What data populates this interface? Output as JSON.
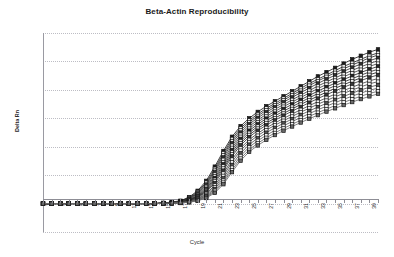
{
  "chart_data": {
    "type": "line",
    "title": "Beta-Actin Reproducibility",
    "xlabel": "Cycle",
    "ylabel": "Delta Rn",
    "grid": true,
    "legend": "none",
    "marker": "square",
    "xlim": [
      1,
      40
    ],
    "ylim": [
      -0.2,
      1.2
    ],
    "ytick_labels": [
      "1.20",
      "1.00",
      "0.80",
      "0.60",
      "0.40",
      "0.20",
      "0.00",
      "-0.20"
    ],
    "ytick_values": [
      1.2,
      1.0,
      0.8,
      0.6,
      0.4,
      0.2,
      0.0,
      -0.2
    ],
    "xtick_labels": [
      "1",
      "3",
      "5",
      "7",
      "9",
      "11",
      "13",
      "15",
      "17",
      "19",
      "21",
      "23",
      "25",
      "27",
      "29",
      "31",
      "33",
      "35",
      "37",
      "39"
    ],
    "xtick_values": [
      1,
      3,
      5,
      7,
      9,
      11,
      13,
      15,
      17,
      19,
      21,
      23,
      25,
      27,
      29,
      31,
      33,
      35,
      37,
      39
    ],
    "x": [
      1,
      2,
      3,
      4,
      5,
      6,
      7,
      8,
      9,
      10,
      11,
      12,
      13,
      14,
      15,
      16,
      17,
      18,
      19,
      20,
      21,
      22,
      23,
      24,
      25,
      26,
      27,
      28,
      29,
      30,
      31,
      32,
      33,
      34,
      35,
      36,
      37,
      38,
      39,
      40
    ],
    "series": [
      {
        "name": "Replicate 1",
        "color": "#1c1c1c",
        "values": [
          0.0,
          0.0,
          0.0,
          0.0,
          0.0,
          0.0,
          0.0,
          0.0,
          0.0,
          0.0,
          0.0,
          0.0,
          0.0,
          0.0,
          0.005,
          0.01,
          0.02,
          0.045,
          0.09,
          0.16,
          0.26,
          0.37,
          0.47,
          0.545,
          0.6,
          0.645,
          0.685,
          0.72,
          0.755,
          0.79,
          0.825,
          0.86,
          0.895,
          0.925,
          0.955,
          0.985,
          1.015,
          1.04,
          1.065,
          1.085
        ]
      },
      {
        "name": "Replicate 2",
        "color": "#232323",
        "values": [
          0.0,
          0.0,
          0.0,
          0.0,
          0.0,
          0.0,
          0.0,
          0.0,
          0.0,
          0.0,
          0.0,
          0.0,
          0.0,
          0.0,
          0.004,
          0.009,
          0.018,
          0.04,
          0.082,
          0.148,
          0.245,
          0.355,
          0.455,
          0.53,
          0.585,
          0.63,
          0.67,
          0.705,
          0.74,
          0.775,
          0.81,
          0.845,
          0.875,
          0.905,
          0.935,
          0.965,
          0.99,
          1.015,
          1.04,
          1.06
        ]
      },
      {
        "name": "Replicate 3",
        "color": "#2b2b2b",
        "values": [
          0.0,
          0.0,
          0.0,
          0.0,
          0.0,
          0.0,
          0.0,
          0.0,
          0.0,
          0.0,
          0.0,
          0.0,
          0.0,
          0.0,
          0.004,
          0.008,
          0.016,
          0.036,
          0.075,
          0.138,
          0.232,
          0.34,
          0.44,
          0.515,
          0.572,
          0.617,
          0.657,
          0.692,
          0.727,
          0.762,
          0.795,
          0.83,
          0.862,
          0.892,
          0.92,
          0.948,
          0.975,
          1.0,
          1.025,
          1.045
        ]
      },
      {
        "name": "Replicate 4",
        "color": "#333333",
        "values": [
          0.0,
          0.0,
          0.0,
          0.0,
          0.0,
          0.0,
          0.0,
          0.0,
          0.0,
          0.0,
          0.0,
          0.0,
          0.0,
          0.0,
          0.003,
          0.007,
          0.015,
          0.033,
          0.07,
          0.13,
          0.22,
          0.325,
          0.425,
          0.5,
          0.558,
          0.603,
          0.643,
          0.678,
          0.713,
          0.747,
          0.78,
          0.813,
          0.845,
          0.875,
          0.903,
          0.93,
          0.957,
          0.982,
          1.005,
          1.025
        ]
      },
      {
        "name": "Replicate 5",
        "color": "#3a3a3a",
        "values": [
          0.0,
          0.0,
          0.0,
          0.0,
          0.0,
          0.0,
          0.0,
          0.0,
          0.0,
          0.0,
          0.0,
          0.0,
          0.0,
          0.0,
          0.003,
          0.006,
          0.013,
          0.03,
          0.064,
          0.12,
          0.205,
          0.308,
          0.408,
          0.485,
          0.543,
          0.588,
          0.628,
          0.663,
          0.697,
          0.73,
          0.762,
          0.795,
          0.827,
          0.856,
          0.884,
          0.911,
          0.937,
          0.962,
          0.985,
          1.005
        ]
      },
      {
        "name": "Replicate 6",
        "color": "#424242",
        "values": [
          0.0,
          0.0,
          0.0,
          0.0,
          0.0,
          0.0,
          0.0,
          0.0,
          0.0,
          0.0,
          0.0,
          0.0,
          0.0,
          0.0,
          0.003,
          0.006,
          0.012,
          0.027,
          0.058,
          0.112,
          0.193,
          0.292,
          0.392,
          0.47,
          0.528,
          0.573,
          0.613,
          0.648,
          0.682,
          0.714,
          0.746,
          0.778,
          0.809,
          0.838,
          0.866,
          0.892,
          0.918,
          0.942,
          0.965,
          0.985
        ]
      },
      {
        "name": "Replicate 7",
        "color": "#262626",
        "values": [
          0.0,
          0.0,
          0.0,
          0.0,
          0.0,
          0.0,
          0.0,
          0.0,
          0.0,
          0.0,
          0.0,
          0.0,
          0.0,
          0.0,
          0.002,
          0.005,
          0.011,
          0.025,
          0.053,
          0.103,
          0.18,
          0.277,
          0.377,
          0.455,
          0.513,
          0.558,
          0.598,
          0.633,
          0.666,
          0.698,
          0.73,
          0.761,
          0.791,
          0.82,
          0.847,
          0.873,
          0.898,
          0.922,
          0.945,
          0.965
        ]
      },
      {
        "name": "Replicate 8",
        "color": "#2e2e2e",
        "values": [
          0.0,
          0.0,
          0.0,
          0.0,
          0.0,
          0.0,
          0.0,
          0.0,
          0.0,
          0.0,
          0.0,
          0.0,
          0.0,
          0.0,
          0.002,
          0.005,
          0.01,
          0.023,
          0.049,
          0.095,
          0.168,
          0.262,
          0.362,
          0.44,
          0.498,
          0.543,
          0.583,
          0.617,
          0.65,
          0.682,
          0.713,
          0.744,
          0.774,
          0.802,
          0.829,
          0.855,
          0.879,
          0.903,
          0.926,
          0.945
        ]
      },
      {
        "name": "Replicate 9",
        "color": "#1f1f1f",
        "values": [
          0.0,
          0.0,
          0.0,
          0.0,
          0.0,
          0.0,
          0.0,
          0.0,
          0.0,
          0.0,
          0.0,
          0.0,
          0.0,
          0.0,
          0.002,
          0.004,
          0.009,
          0.021,
          0.045,
          0.088,
          0.156,
          0.247,
          0.347,
          0.425,
          0.483,
          0.528,
          0.567,
          0.601,
          0.634,
          0.666,
          0.697,
          0.727,
          0.756,
          0.784,
          0.811,
          0.836,
          0.861,
          0.884,
          0.906,
          0.925
        ]
      },
      {
        "name": "Replicate 10",
        "color": "#373737",
        "values": [
          0.0,
          0.0,
          0.0,
          0.0,
          0.0,
          0.0,
          0.0,
          0.0,
          0.0,
          0.0,
          0.0,
          0.0,
          0.0,
          0.0,
          0.002,
          0.004,
          0.008,
          0.019,
          0.041,
          0.08,
          0.144,
          0.232,
          0.332,
          0.41,
          0.468,
          0.513,
          0.552,
          0.586,
          0.619,
          0.65,
          0.68,
          0.71,
          0.739,
          0.766,
          0.792,
          0.818,
          0.842,
          0.865,
          0.887,
          0.905
        ]
      },
      {
        "name": "Replicate 11",
        "color": "#444444",
        "values": [
          0.0,
          0.0,
          0.0,
          0.0,
          0.0,
          0.0,
          0.0,
          0.0,
          0.0,
          0.0,
          0.0,
          0.0,
          0.0,
          0.0,
          0.001,
          0.003,
          0.007,
          0.016,
          0.035,
          0.07,
          0.128,
          0.212,
          0.31,
          0.39,
          0.449,
          0.494,
          0.533,
          0.567,
          0.599,
          0.63,
          0.66,
          0.689,
          0.717,
          0.744,
          0.77,
          0.795,
          0.819,
          0.842,
          0.863,
          0.88
        ]
      },
      {
        "name": "Replicate 12",
        "color": "#4b4b4b",
        "values": [
          0.0,
          0.0,
          0.0,
          0.0,
          0.0,
          0.0,
          0.0,
          0.0,
          0.0,
          0.0,
          0.0,
          0.0,
          0.0,
          0.0,
          0.001,
          0.003,
          0.006,
          0.014,
          0.031,
          0.062,
          0.115,
          0.195,
          0.292,
          0.373,
          0.433,
          0.478,
          0.517,
          0.551,
          0.583,
          0.613,
          0.643,
          0.671,
          0.699,
          0.725,
          0.751,
          0.775,
          0.799,
          0.821,
          0.842,
          0.858
        ]
      },
      {
        "name": "Replicate 13",
        "color": "#545454",
        "values": [
          0.0,
          0.0,
          0.0,
          0.0,
          0.0,
          0.0,
          0.0,
          0.0,
          0.0,
          0.0,
          0.0,
          0.0,
          0.0,
          0.0,
          0.001,
          0.002,
          0.005,
          0.012,
          0.027,
          0.055,
          0.103,
          0.178,
          0.272,
          0.354,
          0.415,
          0.46,
          0.499,
          0.533,
          0.565,
          0.595,
          0.624,
          0.652,
          0.679,
          0.705,
          0.73,
          0.754,
          0.777,
          0.799,
          0.819,
          0.835
        ]
      },
      {
        "name": "Replicate 14",
        "color": "#5c5c5c",
        "values": [
          0.0,
          0.0,
          0.0,
          0.0,
          0.0,
          0.0,
          0.0,
          0.0,
          0.0,
          0.0,
          0.0,
          0.0,
          0.0,
          0.0,
          0.001,
          0.002,
          0.005,
          0.011,
          0.024,
          0.049,
          0.092,
          0.162,
          0.253,
          0.335,
          0.397,
          0.442,
          0.481,
          0.515,
          0.547,
          0.577,
          0.605,
          0.633,
          0.66,
          0.685,
          0.71,
          0.733,
          0.756,
          0.777,
          0.797,
          0.812
        ]
      },
      {
        "name": "Replicate 15",
        "color": "#646464",
        "values": [
          0.0,
          0.0,
          0.0,
          0.0,
          0.0,
          0.0,
          0.0,
          0.0,
          0.0,
          0.0,
          0.0,
          0.0,
          0.0,
          0.0,
          0.001,
          0.002,
          0.004,
          0.01,
          0.021,
          0.044,
          0.083,
          0.148,
          0.236,
          0.317,
          0.379,
          0.424,
          0.463,
          0.497,
          0.529,
          0.558,
          0.586,
          0.614,
          0.64,
          0.665,
          0.689,
          0.712,
          0.734,
          0.755,
          0.775,
          0.79
        ]
      },
      {
        "name": "Replicate 16",
        "color": "#6b6b6b",
        "values": [
          0.0,
          0.0,
          0.0,
          0.0,
          0.0,
          0.0,
          0.0,
          0.0,
          0.0,
          0.0,
          0.0,
          0.0,
          0.0,
          0.0,
          0.001,
          0.002,
          0.004,
          0.009,
          0.019,
          0.039,
          0.075,
          0.136,
          0.221,
          0.302,
          0.364,
          0.409,
          0.448,
          0.482,
          0.513,
          0.542,
          0.57,
          0.597,
          0.622,
          0.647,
          0.67,
          0.693,
          0.714,
          0.735,
          0.754,
          0.772
        ]
      }
    ]
  }
}
